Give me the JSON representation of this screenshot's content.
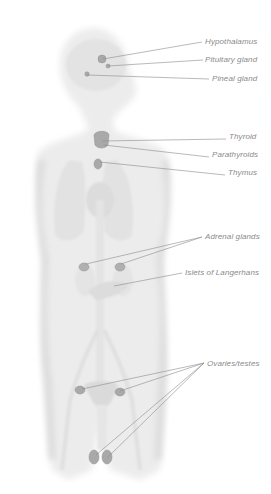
{
  "diagram": {
    "colors": {
      "background": "#ffffff",
      "body_fill": "#e9e9e9",
      "organ_fill": "#dedede",
      "gland_fill": "#a8a8a8",
      "leader_line": "#8c8c8c",
      "label_text": "#8a8a8a"
    },
    "labels": [
      {
        "id": "hypothalamus",
        "text": "Hypothalamus",
        "x": 205,
        "y": 37,
        "targets": [
          [
            103,
            59
          ]
        ],
        "anchor": [
          202,
          42
        ]
      },
      {
        "id": "pituitary",
        "text": "Pituitary gland",
        "x": 205,
        "y": 55,
        "targets": [
          [
            108,
            66
          ]
        ],
        "anchor": [
          203,
          60
        ]
      },
      {
        "id": "pineal",
        "text": "Pineal gland",
        "x": 212,
        "y": 74,
        "targets": [
          [
            87,
            75
          ]
        ],
        "anchor": [
          209,
          79
        ]
      },
      {
        "id": "thyroid",
        "text": "Thyroid",
        "x": 229,
        "y": 132,
        "targets": [
          [
            102,
            141
          ]
        ],
        "anchor": [
          226,
          139
        ]
      },
      {
        "id": "parathyroids",
        "text": "Parathyroids",
        "x": 212,
        "y": 150,
        "targets": [
          [
            104,
            145
          ]
        ],
        "anchor": [
          209,
          157
        ]
      },
      {
        "id": "thymus",
        "text": "Thymus",
        "x": 228,
        "y": 168,
        "targets": [
          [
            100,
            162
          ]
        ],
        "anchor": [
          225,
          175
        ]
      },
      {
        "id": "adrenal",
        "text": "Adrenal glands",
        "x": 205,
        "y": 232,
        "targets": [
          [
            86,
            264
          ],
          [
            121,
            264
          ]
        ],
        "anchor": [
          202,
          237
        ]
      },
      {
        "id": "islets",
        "text": "Islets of Langerhans",
        "x": 185,
        "y": 268,
        "targets": [
          [
            114,
            286
          ]
        ],
        "anchor": [
          182,
          273
        ]
      },
      {
        "id": "gonads",
        "text": "Ovaries/testes",
        "x": 207,
        "y": 359,
        "targets": [
          [
            82,
            389
          ],
          [
            120,
            391
          ],
          [
            96,
            455
          ],
          [
            107,
            458
          ]
        ],
        "anchor": [
          204,
          363
        ]
      }
    ]
  }
}
